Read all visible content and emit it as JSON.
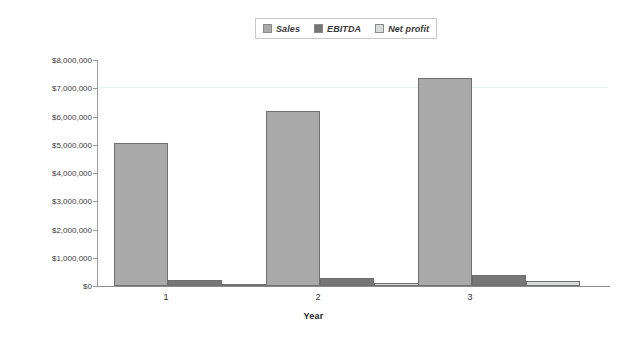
{
  "chart_data": {
    "type": "bar",
    "title": "",
    "xlabel": "Year",
    "ylabel": "",
    "categories": [
      "1",
      "2",
      "3"
    ],
    "series": [
      {
        "name": "Sales",
        "color": "#a9a9a9",
        "values": [
          5060000,
          6190000,
          7360000
        ]
      },
      {
        "name": "EBITDA",
        "color": "#767676",
        "values": [
          230000,
          280000,
          400000
        ]
      },
      {
        "name": "Net profit",
        "color": "#d9dada",
        "values": [
          50000,
          120000,
          180000
        ]
      }
    ],
    "ylim": [
      0,
      8000000
    ],
    "ytick_values": [
      0,
      1000000,
      2000000,
      3000000,
      4000000,
      5000000,
      6000000,
      7000000,
      8000000
    ],
    "ytick_labels": [
      "$0",
      "$1,000,000",
      "$2,000,000",
      "$3,000,000",
      "$4,000,000",
      "$5,000,000",
      "$6,000,000",
      "$7,000,000",
      "$8,000,000"
    ],
    "grid": "single-highlight-line-at-7000000",
    "legend_position": "top-center"
  },
  "legend": {
    "items": [
      {
        "label": "Sales",
        "swatch": "#a9a9a9"
      },
      {
        "label": "EBITDA",
        "swatch": "#767676"
      },
      {
        "label": "Net profit",
        "swatch": "#d9dada"
      }
    ]
  },
  "axes": {
    "x_title": "Year",
    "x_labels": [
      "1",
      "2",
      "3"
    ],
    "y_labels": [
      "$8,000,000",
      "$7,000,000",
      "$6,000,000",
      "$5,000,000",
      "$4,000,000",
      "$3,000,000",
      "$2,000,000",
      "$1,000,000",
      "$0"
    ]
  },
  "colors": {
    "sales": "#a9a9a9",
    "ebitda": "#767676",
    "net_profit": "#d9dada",
    "axis": "#8c8c8c",
    "gridline": "#e3f1f1",
    "background": "#ffffff"
  }
}
